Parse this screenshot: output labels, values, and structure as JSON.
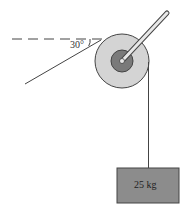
{
  "figure": {
    "angle_label": "30°",
    "mass_label": "25 kg",
    "colors": {
      "line": "#444444",
      "pulley_outer": "#d4d4d4",
      "pulley_inner": "#7a7a7a",
      "box_fill": "#8c8c8c",
      "handle": "#e8e8e8"
    }
  }
}
